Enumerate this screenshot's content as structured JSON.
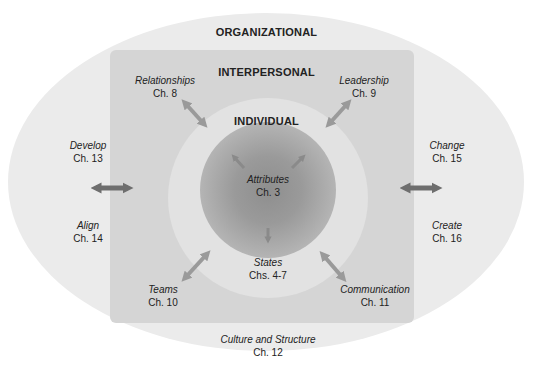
{
  "levels": {
    "organizational": "ORGANIZATIONAL",
    "interpersonal": "INTERPERSONAL",
    "individual": "INDIVIDUAL"
  },
  "individual_topics": {
    "attributes": {
      "name": "Attributes",
      "chapter": "Ch. 3"
    },
    "states": {
      "name": "States",
      "chapter": "Chs. 4-7"
    }
  },
  "interpersonal_topics": {
    "relationships": {
      "name": "Relationships",
      "chapter": "Ch. 8"
    },
    "leadership": {
      "name": "Leadership",
      "chapter": "Ch. 9"
    },
    "teams": {
      "name": "Teams",
      "chapter": "Ch. 10"
    },
    "communication": {
      "name": "Communication",
      "chapter": "Ch. 11"
    }
  },
  "organizational_topics": {
    "culture": {
      "name": "Culture and Structure",
      "chapter": "Ch. 12"
    },
    "develop": {
      "name": "Develop",
      "chapter": "Ch. 13"
    },
    "align": {
      "name": "Align",
      "chapter": "Ch. 14"
    },
    "change": {
      "name": "Change",
      "chapter": "Ch. 15"
    },
    "create": {
      "name": "Create",
      "chapter": "Ch. 16"
    }
  },
  "colors": {
    "outer": "#ebebeb",
    "interpersonal": "#d5d5d5",
    "individual": "#e2e2e2",
    "arrow_light": "#9a9a9a",
    "arrow_dark": "#6e6e6e"
  }
}
